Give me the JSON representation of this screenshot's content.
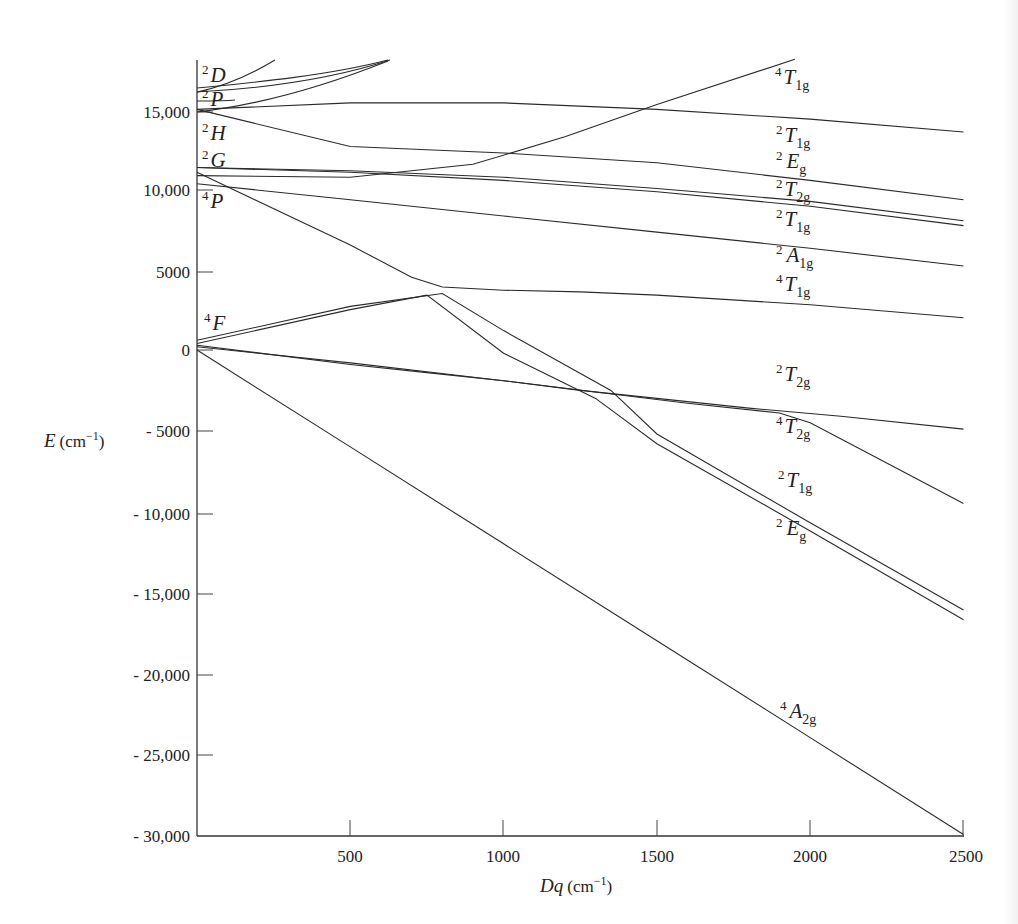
{
  "chart_data": {
    "type": "line",
    "title": "",
    "xlabel": "Dq (cm^-1)",
    "ylabel": "E (cm^-1)",
    "xlim": [
      0,
      2500
    ],
    "ylim": [
      -30000,
      18000
    ],
    "grid": false,
    "legend": "none (curves labeled directly)",
    "x_ticks": [
      "500",
      "1000",
      "1500",
      "2000",
      "2500"
    ],
    "y_ticks": [
      "15,000",
      "10,000",
      "5000",
      "0",
      "- 5000",
      "- 10,000",
      "- 15,000",
      "- 20,000",
      "- 25,000",
      "- 30,000"
    ],
    "free_ion_terms": [
      {
        "term": "2D",
        "E": 16500
      },
      {
        "term": "2P",
        "E": 15600
      },
      {
        "term": "2H",
        "E": 14900
      },
      {
        "term": "2G",
        "E": 11300
      },
      {
        "term": "4P",
        "E": 10800
      },
      {
        "term": "4F",
        "E": 0
      }
    ],
    "series": [
      {
        "name": "4A2g",
        "x": [
          0,
          500,
          1000,
          1500,
          2000,
          2500
        ],
        "y": [
          0,
          -6000,
          -12000,
          -18000,
          -24000,
          -30000
        ]
      },
      {
        "name": "4T2g",
        "x": [
          0,
          500,
          1000,
          1300,
          1600,
          1900,
          2000,
          2200,
          2500
        ],
        "y": [
          200,
          -800,
          -1900,
          -2600,
          -3300,
          -3900,
          -4500,
          -6500,
          -9500
        ]
      },
      {
        "name": "2Eg",
        "x": [
          0,
          500,
          750,
          1000,
          1300,
          1500,
          2000,
          2500
        ],
        "y": [
          400,
          2500,
          3400,
          -200,
          -3000,
          -5800,
          -11200,
          -16700
        ]
      },
      {
        "name": "2T1g (low)",
        "x": [
          0,
          500,
          800,
          1000,
          1350,
          1500,
          2000,
          2500
        ],
        "y": [
          600,
          2700,
          3500,
          1200,
          -2500,
          -5200,
          -10700,
          -16100
        ]
      },
      {
        "name": "2T2g (low)",
        "x": [
          0,
          500,
          750,
          1000,
          1250,
          1500,
          1800,
          2100,
          2500
        ],
        "y": [
          300,
          -900,
          -1400,
          -1900,
          -2500,
          -3000,
          -3600,
          -4100,
          -4900
        ]
      },
      {
        "name": "4T1g (4F)",
        "x": [
          0,
          500,
          700,
          800,
          1000,
          1250,
          1500,
          2000,
          2500
        ],
        "y": [
          11000,
          6500,
          4500,
          3900,
          3700,
          3600,
          3400,
          2800,
          2000
        ]
      },
      {
        "name": "2A1g",
        "x": [
          0,
          500,
          1000,
          1500,
          2000,
          2500
        ],
        "y": [
          10300,
          9300,
          8300,
          7300,
          6300,
          5200
        ]
      },
      {
        "name": "2T1g (2G)",
        "x": [
          0,
          500,
          1000,
          1500,
          2000,
          2500
        ],
        "y": [
          11300,
          11000,
          10500,
          9800,
          8900,
          7700
        ]
      },
      {
        "name": "2T2g (2G)",
        "x": [
          0,
          500,
          1000,
          1500,
          2000,
          2500
        ],
        "y": [
          11300,
          11100,
          10700,
          10000,
          9200,
          8000
        ]
      },
      {
        "name": "2Eg (2G)",
        "x": [
          0,
          500,
          1000,
          1500,
          2000,
          2500
        ],
        "y": [
          14900,
          12600,
          12200,
          11600,
          10500,
          9300
        ]
      },
      {
        "name": "2T1g (2H)",
        "x": [
          0,
          500,
          1000,
          1500,
          2000,
          2500
        ],
        "y": [
          14900,
          15300,
          15300,
          14900,
          14300,
          13500
        ]
      },
      {
        "name": "4T1g (4P)",
        "x": [
          0,
          500,
          900,
          1200,
          1500,
          1950
        ],
        "y": [
          10800,
          10700,
          11500,
          13200,
          15200,
          18000
        ]
      }
    ]
  },
  "axes": {
    "y_title_main": "E",
    "y_title_unit": "(cm",
    "y_title_exp": "−1",
    "y_title_close": ")",
    "x_title_main": "Dq",
    "x_title_unit": "(cm",
    "x_title_exp": "−1",
    "x_title_close": ")"
  },
  "left_labels": [
    {
      "sup": "2",
      "base": "D"
    },
    {
      "sup": "2",
      "base": "P"
    },
    {
      "sup": "2",
      "base": "H"
    },
    {
      "sup": "2",
      "base": "G"
    },
    {
      "sup": "4",
      "base": "P"
    },
    {
      "sup": "4",
      "base": "F"
    }
  ],
  "right_labels": [
    {
      "sup": "4",
      "base": "T",
      "sub": "1g"
    },
    {
      "sup": "2",
      "base": "T",
      "sub": "1g"
    },
    {
      "sup": "2",
      "base": "E",
      "sub": "g"
    },
    {
      "sup": "2",
      "base": "T",
      "sub": "2g"
    },
    {
      "sup": "2",
      "base": "T",
      "sub": "1g"
    },
    {
      "sup": "2",
      "base": "A",
      "sub": "1g"
    },
    {
      "sup": "4",
      "base": "T",
      "sub": "1g"
    },
    {
      "sup": "2",
      "base": "T",
      "sub": "2g"
    },
    {
      "sup": "4",
      "base": "T",
      "sub": "2g"
    },
    {
      "sup": "2",
      "base": "T",
      "sub": "1g"
    },
    {
      "sup": "2",
      "base": "E",
      "sub": "g"
    },
    {
      "sup": "4",
      "base": "A",
      "sub": "2g"
    }
  ]
}
